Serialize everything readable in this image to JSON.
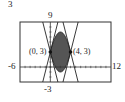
{
  "figure_number": "3",
  "chart_data": {
    "type": "line",
    "title": "",
    "window": {
      "xmin": -6,
      "xmax": 12,
      "ymin": -3,
      "ymax": 9
    },
    "tick_labels": {
      "xmin": "-6",
      "xmax": "12",
      "ymin": "-3",
      "ymax": "9"
    },
    "series": [
      {
        "name": "y = -(x-2)^2 + 7",
        "kind": "parabola-down"
      },
      {
        "name": "y = (x-2)^2 - 1",
        "kind": "parabola-up"
      },
      {
        "name": "tangent line at (0,3), slope 4",
        "kind": "line"
      },
      {
        "name": "tangent line at (0,3), slope -4",
        "kind": "line"
      },
      {
        "name": "tangent line at (4,3), slope -4",
        "kind": "line"
      },
      {
        "name": "tangent line at (4,3), slope 4",
        "kind": "line"
      }
    ],
    "shaded_region": {
      "between": [
        "y = (x-2)^2 - 1",
        "y = -(x-2)^2 + 7"
      ],
      "x_range": [
        0,
        4
      ],
      "color": "#555555"
    },
    "points": [
      {
        "x": 0,
        "y": 3,
        "label": "(0, 3)"
      },
      {
        "x": 4,
        "y": 3,
        "label": "(4, 3)"
      }
    ],
    "grid": false
  }
}
